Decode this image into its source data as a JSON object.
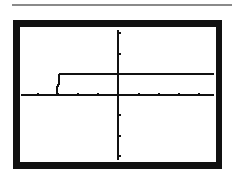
{
  "device": {
    "type": "graphing-calculator-screen",
    "frame_color": "#111111",
    "screen_color": "#ffffff",
    "plot_color": "#111111"
  },
  "graph": {
    "description": "Step function graph on calculator window",
    "x_axis": {
      "ticks_left": 4,
      "ticks_right": 4
    },
    "y_axis": {
      "ticks_up": 2,
      "ticks_down": 3
    },
    "function": {
      "kind": "step",
      "low_value": 0,
      "jump_x_tick": -3,
      "high_value_ticks": 1
    }
  }
}
